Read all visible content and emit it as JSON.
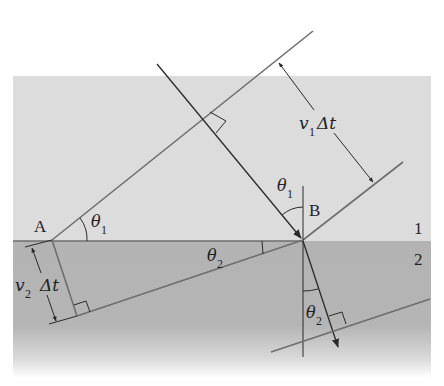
{
  "diagram": {
    "colors": {
      "medium1": "#dcdcdc",
      "medium2": "#b3b3b3",
      "line_gray": "#6e6e6e",
      "line_dark": "#2a2a2a"
    },
    "labels": {
      "point_a": "A",
      "point_b": "B",
      "medium_1": "1",
      "medium_2": "2",
      "theta": "θ",
      "sub1": "1",
      "sub2": "2",
      "v": "v",
      "delta_t": "Δt"
    },
    "annotations": {
      "v1_dt": "v1 Δt",
      "v2_dt": "v2 Δt",
      "theta1_at_a": "θ1",
      "theta1_at_b": "θ1",
      "theta2_at_interface": "θ2",
      "theta2_refracted": "θ2"
    }
  }
}
